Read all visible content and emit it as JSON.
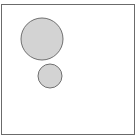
{
  "canvas": {
    "width": 137,
    "height": 140,
    "background": "#ffffff",
    "frame": {
      "x": 1,
      "y": 4,
      "width": 133,
      "height": 130,
      "stroke": "#6b6b6b"
    }
  },
  "shapes": [
    {
      "type": "circle",
      "name": "large-circle",
      "cx": 42,
      "cy": 39,
      "r": 21,
      "fill": "#d3d3d3",
      "stroke": "#707070"
    },
    {
      "type": "circle",
      "name": "small-circle",
      "cx": 50,
      "cy": 76,
      "r": 12,
      "fill": "#d3d3d3",
      "stroke": "#707070"
    }
  ]
}
